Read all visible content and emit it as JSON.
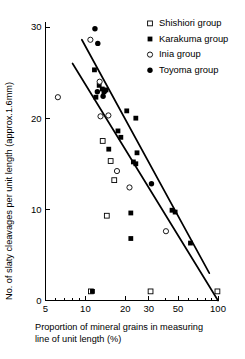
{
  "chart_data": {
    "type": "scatter",
    "title": "",
    "xlabel": "Proportion of mineral grains in measuring line of unit length (%)",
    "ylabel": "No. of slaty cleavages per unit length (approx. 1.6mm)",
    "xscale": "log",
    "yscale": "linear",
    "xlim": [
      5,
      100
    ],
    "ylim": [
      0,
      30
    ],
    "xticks": [
      5,
      10,
      20,
      30,
      50,
      100
    ],
    "xtick_labels": [
      "5",
      "10",
      "20",
      "30",
      "50",
      "100"
    ],
    "yticks": [
      0,
      10,
      20,
      30
    ],
    "ytick_labels": [
      "0",
      "10",
      "20",
      "30"
    ],
    "grid": false,
    "legend_position": "top-right",
    "series": [
      {
        "name": "Shishiori group",
        "marker": "open-square",
        "points": [
          {
            "x": 13.5,
            "y": 17.5
          },
          {
            "x": 15.5,
            "y": 15.3
          },
          {
            "x": 16.5,
            "y": 13.2
          },
          {
            "x": 14.5,
            "y": 9.3
          },
          {
            "x": 11.0,
            "y": 1.0
          },
          {
            "x": 31.0,
            "y": 1.0
          },
          {
            "x": 99.0,
            "y": 1.0
          }
        ]
      },
      {
        "name": "Karakuma group",
        "marker": "filled-square",
        "points": [
          {
            "x": 11.7,
            "y": 25.3
          },
          {
            "x": 12.7,
            "y": 23.6
          },
          {
            "x": 13.4,
            "y": 23.2
          },
          {
            "x": 13.8,
            "y": 22.9
          },
          {
            "x": 14.3,
            "y": 23.1
          },
          {
            "x": 12.0,
            "y": 22.3
          },
          {
            "x": 20.5,
            "y": 20.8
          },
          {
            "x": 24.0,
            "y": 20.0
          },
          {
            "x": 17.6,
            "y": 18.6
          },
          {
            "x": 18.5,
            "y": 17.9
          },
          {
            "x": 15.0,
            "y": 16.6
          },
          {
            "x": 24.5,
            "y": 16.2
          },
          {
            "x": 23.0,
            "y": 15.2
          },
          {
            "x": 24.0,
            "y": 15.0
          },
          {
            "x": 22.0,
            "y": 9.6
          },
          {
            "x": 22.0,
            "y": 6.8
          },
          {
            "x": 45.0,
            "y": 9.9
          },
          {
            "x": 47.5,
            "y": 9.7
          },
          {
            "x": 62.0,
            "y": 6.3
          },
          {
            "x": 11.3,
            "y": 1.0
          }
        ]
      },
      {
        "name": "Inia group",
        "marker": "open-circle",
        "points": [
          {
            "x": 10.9,
            "y": 28.6
          },
          {
            "x": 6.2,
            "y": 22.3
          },
          {
            "x": 12.8,
            "y": 24.0
          },
          {
            "x": 13.0,
            "y": 20.2
          },
          {
            "x": 14.9,
            "y": 20.3
          },
          {
            "x": 17.3,
            "y": 14.2
          },
          {
            "x": 21.5,
            "y": 12.4
          },
          {
            "x": 40.5,
            "y": 7.6
          }
        ]
      },
      {
        "name": "Toyoma group",
        "marker": "filled-circle",
        "points": [
          {
            "x": 11.8,
            "y": 29.8
          },
          {
            "x": 12.4,
            "y": 28.2
          },
          {
            "x": 12.3,
            "y": 22.9
          },
          {
            "x": 13.6,
            "y": 22.4
          },
          {
            "x": 14.0,
            "y": 23.0
          },
          {
            "x": 31.5,
            "y": 12.8
          }
        ]
      }
    ],
    "fit_lines": [
      {
        "name": "upper-regression",
        "x1": 9.4,
        "y1": 28.6,
        "x2": 86.0,
        "y2": 3.0
      },
      {
        "name": "lower-regression",
        "x1": 8.0,
        "y1": 26.0,
        "x2": 100.0,
        "y2": 0.0
      }
    ]
  },
  "legend": {
    "items": [
      {
        "label": "Shishiori group",
        "marker": "open-square"
      },
      {
        "label": "Karakuma group",
        "marker": "filled-square"
      },
      {
        "label": "Inia group",
        "marker": "open-circle"
      },
      {
        "label": "Toyoma group",
        "marker": "filled-circle"
      }
    ]
  },
  "axes": {
    "y_title": "No. of slaty cleavages per unit length (approx.1.6mm)",
    "x_title_line1": "Proportion of mineral grains in measuring",
    "x_title_line2": "line of unit length (%)"
  }
}
